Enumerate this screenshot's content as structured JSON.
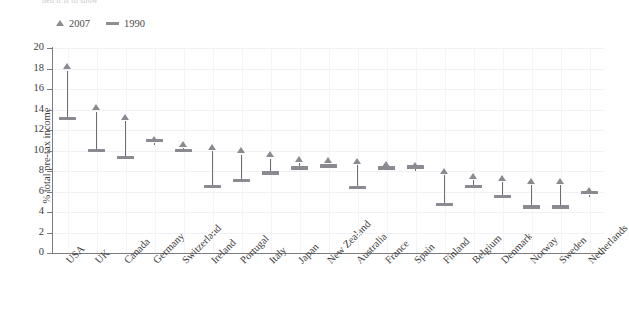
{
  "top_caption": "nen it is to snow",
  "axis": {
    "y_title": "% total pre-tax income",
    "y_ticks": [
      0,
      2,
      4,
      6,
      8,
      10,
      12,
      14,
      16,
      18,
      20
    ],
    "y_min": 0,
    "y_max": 20
  },
  "legend": {
    "items": [
      {
        "label": "2007",
        "marker": "triangle-up-icon",
        "color": "#8d8d93"
      },
      {
        "label": "1990",
        "marker": "horizontal-bar-icon",
        "color": "#8d8d93"
      }
    ]
  },
  "chart_data": {
    "type": "scatter",
    "title": "",
    "subtitle": "",
    "xlabel": "",
    "ylabel": "% total pre-tax income",
    "ylim": [
      0,
      20
    ],
    "grid": true,
    "legend_position": "top-left",
    "annotation": "Arrows connect the 1990 value (bar) to the 2007 value (triangle) for each country.",
    "categories": [
      "USA",
      "UK",
      "Canada",
      "Germany",
      "Switzerland",
      "Ireland",
      "Portugal",
      "Italy",
      "Japan",
      "New Zealand",
      "Australia",
      "France",
      "Spain",
      "Finland",
      "Belgium",
      "Denmark",
      "Norway",
      "Sweden",
      "Netherlands"
    ],
    "series": [
      {
        "name": "1990",
        "marker": "bar",
        "values": [
          13.1,
          10.0,
          9.3,
          11.0,
          10.0,
          6.5,
          7.1,
          7.8,
          8.3,
          8.5,
          6.4,
          8.3,
          8.4,
          4.7,
          6.5,
          5.5,
          4.5,
          4.5,
          5.9
        ]
      },
      {
        "name": "2007",
        "marker": "triangle",
        "values": [
          18.2,
          14.2,
          13.3,
          11.1,
          10.6,
          10.3,
          10.0,
          9.6,
          9.2,
          9.1,
          9.0,
          8.7,
          8.6,
          8.0,
          7.5,
          7.3,
          7.0,
          7.0,
          6.1
        ]
      }
    ]
  }
}
